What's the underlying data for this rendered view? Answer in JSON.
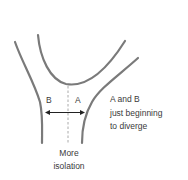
{
  "diagram": {
    "type": "divergence-schematic",
    "colors": {
      "curve": "#7a7a7a",
      "dashed": "#a0a0a0",
      "arrow": "#222222",
      "text": "#3a3a3a"
    },
    "labels": {
      "left_population": "B",
      "right_population": "A"
    },
    "note": {
      "line1": "A and B",
      "line2": "just beginning",
      "line3": "to diverge"
    },
    "caption": {
      "line1": "More",
      "line2": "isolation"
    },
    "arrow": {
      "direction": "bidirectional"
    }
  }
}
